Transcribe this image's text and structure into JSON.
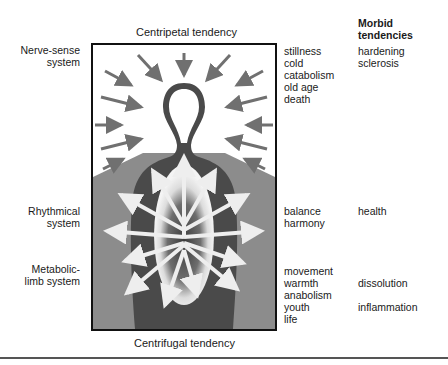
{
  "diagram": {
    "top_label": "Centripetal tendency",
    "bottom_label": "Centrifugal tendency",
    "systems": [
      {
        "label_line1": "Nerve-sense",
        "label_line2": "system"
      },
      {
        "label_line1": "Rhythmical",
        "label_line2": "system"
      },
      {
        "label_line1": "Metabolic-",
        "label_line2": "limb system"
      }
    ],
    "qualities": {
      "nerve_sense": [
        "stillness",
        "cold",
        "catabolism",
        "old age",
        "death"
      ],
      "rhythmical": [
        "balance",
        "harmony"
      ],
      "metabolic": [
        "movement",
        "warmth",
        "anabolism",
        "youth",
        "life"
      ]
    },
    "morbid": {
      "heading_line1": "Morbid",
      "heading_line2": "tendencies",
      "nerve_sense": [
        "hardening",
        "sclerosis"
      ],
      "rhythmical": [
        "health"
      ],
      "metabolic": [
        "dissolution",
        "inflammation"
      ]
    },
    "colors": {
      "frame": "#111111",
      "body": "#4a4a4a",
      "background_gray": "#8c8c8c",
      "arrows_in": "#707070",
      "arrows_out": "#e8e8e8"
    }
  }
}
